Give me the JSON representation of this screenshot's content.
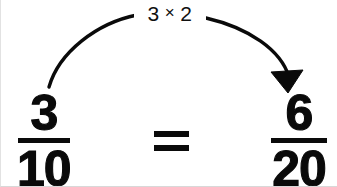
{
  "diagram": {
    "operation_label": {
      "left_term": "3",
      "symbol": "×",
      "right_term": "2",
      "full_text": "3 × 2"
    },
    "left_fraction": {
      "numerator": "3",
      "denominator": "10"
    },
    "right_fraction": {
      "numerator": "6",
      "denominator": "20"
    },
    "relation": "=",
    "colors": {
      "ink": "#0a0a0a",
      "label_ink": "#101010",
      "background": "#ffffff",
      "border": "#d8d8d8"
    },
    "arrow": {
      "direction": "left-to-right",
      "style": "curved-arc-with-filled-arrowhead",
      "start_point": "48,87",
      "end_point": "292,86"
    }
  }
}
